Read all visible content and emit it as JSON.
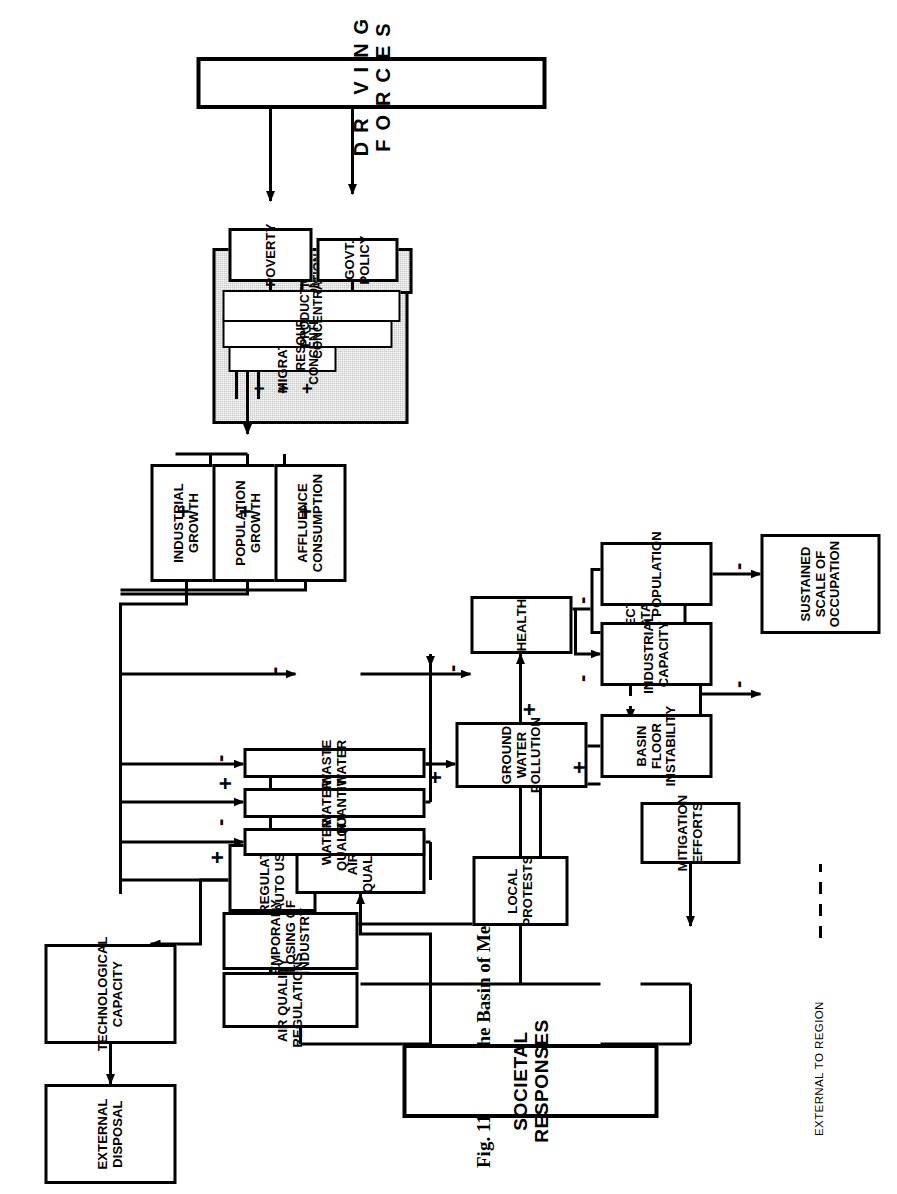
{
  "figure": {
    "number": "Fig. 11.13",
    "title": "The Basin of Mexico"
  },
  "legend": {
    "dashed_label": "EXTERNAL TO REGION"
  },
  "driving_forces": {
    "label": "DRIVING FORCES"
  },
  "societal": {
    "label": "SOCIETAL RESPONSES"
  },
  "nodes": {
    "technological_capacity": "TECHNOLOGICAL CAPACITY",
    "external_disposal": "EXTERNAL DISPOSAL",
    "regulate_auto_use": "REGULATE AUTO USE",
    "temporary_closing": "TEMPORARY CLOSING OF INDUSTRY",
    "air_quality_regulations": "AIR QUALITY REGULATIONS",
    "local_protests": "LOCAL PROTESTS",
    "mitigation_efforts": "MITIGATION EFFORTS",
    "tectonic_instability": "TECTONIC INSTABILITY",
    "air_quality": "AIR QUALITY",
    "water_quality": "WATER QUALITY",
    "water_quantity": "WATER QUANTITY",
    "waste_water": "WASTE WATER",
    "health": "HEALTH",
    "ground_water_pollution": "GROUND WATER POLLUTION",
    "population": "POPULATION",
    "industrial_capacity": "INDUSTRIAL CAPACITY",
    "basin_floor_instability": "BASIN FLOOR INSTABILITY",
    "sustained_scale": "SUSTAINED SCALE OF OCCUPATION",
    "industrial_growth": "INDUSTRIAL GROWTH",
    "population_growth": "POPULATION GROWTH",
    "affluence_consumption": "AFFLUENCE CONSUMPTION",
    "migration": "MIGRATION",
    "resources_concentration": "RESOURCES CONCENTRATION",
    "production_concentration": "PRODUCTION CONCENTRATION",
    "poverty": "POVERTY",
    "govt_policy": "GOVT. POLICY"
  },
  "signs": {
    "air_quality": "-",
    "water_quality_plus": "+",
    "water_quality_minus": "-",
    "water_quantity": "-",
    "waste_water": "+",
    "health": "-",
    "ground_water_pollution_top": "+",
    "ground_water_pollution_side": "+",
    "population": "-",
    "industrial_capacity": "-",
    "basin_floor_instability": "+",
    "sustained_from_population": "-",
    "sustained_from_basin": "-",
    "industrial_growth": "+",
    "population_growth": "+",
    "affluence_consumption": "+",
    "migration": "+",
    "resources_concentration": "+",
    "production_concentration": "+"
  },
  "colors": {
    "line": "#000000",
    "shade": "#c9c9c9",
    "background": "#ffffff"
  }
}
